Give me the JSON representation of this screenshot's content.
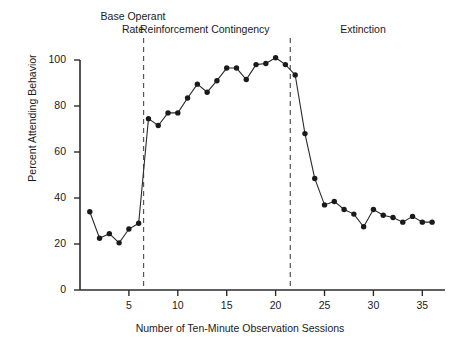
{
  "chart_data": {
    "type": "line",
    "title": "",
    "xlabel": "Number of Ten-Minute Observation Sessions",
    "ylabel": "Percent Attending Behavior",
    "xlim": [
      0,
      36.5
    ],
    "ylim": [
      0,
      100
    ],
    "grid": false,
    "legend": "none",
    "marker": "filled-circle",
    "line_color": "#2b2b2b",
    "marker_color": "#1a1a1a",
    "yticks": [
      0,
      20,
      40,
      60,
      80,
      100
    ],
    "ytick_labels": [
      "0",
      "20",
      "40",
      "60",
      "80",
      "100"
    ],
    "xticks": [
      5,
      10,
      15,
      20,
      25,
      30,
      35
    ],
    "xtick_labels": [
      "5",
      "10",
      "15",
      "20",
      "25",
      "30",
      "35"
    ],
    "x": [
      1,
      2,
      3,
      4,
      5,
      6,
      7,
      8,
      9,
      10,
      11,
      12,
      13,
      14,
      15,
      16,
      17,
      18,
      19,
      20,
      21,
      22,
      23,
      24,
      25,
      26,
      27,
      28,
      29,
      30,
      31,
      32,
      33,
      34,
      35,
      36
    ],
    "values": [
      34,
      22.5,
      24.5,
      20.5,
      26.5,
      29,
      74.5,
      71.5,
      77,
      77,
      83.5,
      89.5,
      86,
      91,
      96.5,
      96.5,
      91.5,
      98,
      98.5,
      101,
      98,
      93.5,
      68,
      48.5,
      37,
      38.5,
      35,
      33,
      27.5,
      35,
      32.5,
      31.5,
      29.5,
      32,
      29.5,
      29.5
    ],
    "annotations": [
      {
        "name": "phase-divider-1",
        "type": "vline",
        "x": 6.5,
        "style": "dashed"
      },
      {
        "name": "phase-divider-2",
        "type": "vline",
        "x": 21.5,
        "style": "dashed"
      }
    ],
    "phases": [
      {
        "id": "base",
        "label": "Base Operant\nRate",
        "label_line1": "Base Operant",
        "label_line2": "Rate",
        "x_start": 1,
        "x_end": 6.5
      },
      {
        "id": "reinforcement",
        "label": "Reinforcement Contingency",
        "x_start": 6.5,
        "x_end": 21.5
      },
      {
        "id": "extinction",
        "label": "Extinction",
        "x_start": 21.5,
        "x_end": 36.5
      }
    ]
  },
  "phases": {
    "base_line1": "Base Operant",
    "base_line2": "Rate",
    "reinforcement": "Reinforcement Contingency",
    "extinction": "Extinction"
  },
  "axes": {
    "ylabel": "Percent Attending Behavior",
    "xlabel": "Number of Ten-Minute Observation Sessions"
  }
}
